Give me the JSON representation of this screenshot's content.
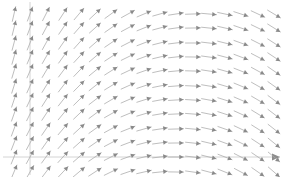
{
  "figure": {
    "title": "",
    "background_color": "#ffffff",
    "width": 292,
    "height": 177
  },
  "axes": {
    "x_axis": {
      "name": "x-axis",
      "color": "#c9c9c9",
      "y_pixel": 157,
      "x_start_pixel": 3,
      "x_end_pixel": 280,
      "has_arrowhead": true,
      "arrowhead_end": "right",
      "label": "",
      "tick_labels": []
    },
    "y_axis": {
      "name": "y-axis",
      "color": "#c9c9c9",
      "x_pixel": 30,
      "y_start_pixel": 2,
      "y_end_pixel": 175,
      "has_arrowhead": false,
      "label": "",
      "tick_labels": []
    }
  },
  "chart_data": {
    "type": "scatter",
    "plot_subtype": "quiver-direction-field",
    "title": "",
    "subtitle": "",
    "xlabel": "",
    "ylabel": "",
    "xlim": [
      0,
      292
    ],
    "ylim": [
      0,
      177
    ],
    "grid": false,
    "legend": null,
    "annotations": [],
    "arrow_color": "#a8a8a8",
    "arrow_head_color": "#8a8a8a",
    "arrow_length_px": 15,
    "grid_columns": 17,
    "grid_rows": 12,
    "grid_x_start": 14,
    "grid_x_step": 16.2,
    "grid_y_start": 14,
    "grid_y_step": 14.4,
    "angle_model": {
      "formula_deg": "angle = 72 - 108 * (col / (ncols - 1))",
      "angle_start_deg": 72,
      "angle_end_deg": -36,
      "row_tilt_deg_per_row": -0.9,
      "note": "angle measured counter-clockwise from the positive x direction, in screen-up-positive convention"
    },
    "columns_x": [
      14,
      30,
      46,
      63,
      79,
      95,
      111,
      128,
      144,
      160,
      176,
      193,
      209,
      225,
      241,
      258,
      274
    ],
    "rows_y": [
      14,
      28,
      43,
      57,
      71,
      86,
      100,
      114,
      129,
      143,
      157,
      172
    ],
    "series": [
      {
        "name": "direction-field",
        "angles_deg_by_column": [
          72,
          65,
          58,
          52,
          45,
          38,
          31,
          24,
          18,
          11,
          4,
          -3,
          -10,
          -17,
          -23,
          -30,
          -36
        ]
      }
    ]
  }
}
